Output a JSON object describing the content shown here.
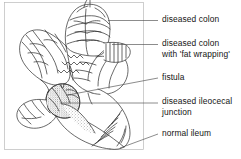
{
  "figure": {
    "frame_color": "#b5b5b5",
    "ink_color": "#2a2a2a",
    "background_color": "#ffffff",
    "label_color": "#141414"
  },
  "labels": [
    {
      "id": "diseased-colon",
      "line1": "diseased colon",
      "line2": "",
      "text_x": 162,
      "text_y": 14,
      "leader": {
        "x1": 108,
        "y1": 20.5,
        "x2": 158,
        "y2": 20.5
      }
    },
    {
      "id": "diseased-colon-fat-wrapping",
      "line1": "diseased colon",
      "line2": "with 'fat wrapping'",
      "text_x": 162,
      "text_y": 38,
      "leader": {
        "x1": 112,
        "y1": 44.5,
        "x2": 158,
        "y2": 44.5
      }
    },
    {
      "id": "fistula",
      "line1": "fistula",
      "line2": "",
      "text_x": 162,
      "text_y": 72,
      "leader": {
        "x1": 68,
        "y1": 95,
        "x2": 158,
        "y2": 78
      }
    },
    {
      "id": "diseased-ileocecal-junction",
      "line1": "diseased ileocecal",
      "line2": "junction",
      "text_x": 162,
      "text_y": 96,
      "leader": {
        "x1": 60,
        "y1": 103,
        "x2": 158,
        "y2": 103
      }
    },
    {
      "id": "normal-ileum",
      "line1": "normal ileum",
      "line2": "",
      "text_x": 162,
      "text_y": 128,
      "leader": {
        "x1": 120,
        "y1": 148,
        "x2": 158,
        "y2": 134
      }
    }
  ],
  "frame": {
    "x": 4,
    "y": 2,
    "width": 140,
    "height": 148
  }
}
